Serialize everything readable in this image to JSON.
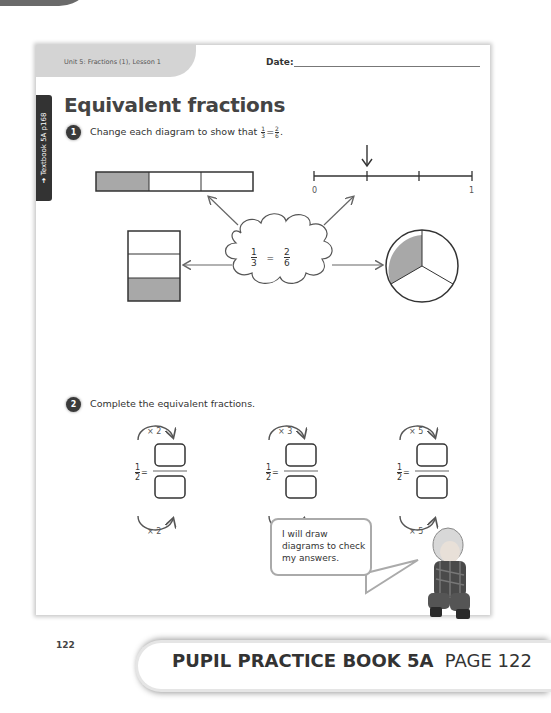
{
  "header": {
    "unit_lesson": "Unit 5: Fractions (1), Lesson 1",
    "date_label": "Date:",
    "side_tab": "➜ Textbook 5A p168"
  },
  "title": "Equivalent fractions",
  "question1": {
    "number": "1",
    "text": "Change each diagram to show that",
    "frac_left": {
      "num": "1",
      "den": "3"
    },
    "equals": "=",
    "frac_right": {
      "num": "2",
      "den": "6"
    },
    "period": ".",
    "cloud": {
      "num1": "1",
      "den1": "3",
      "equals": "=",
      "num2": "2",
      "den2": "6"
    },
    "number_line": {
      "start": "0",
      "end": "1"
    }
  },
  "question2": {
    "number": "2",
    "text": "Complete the equivalent fractions.",
    "items": [
      {
        "num": "1",
        "den": "2",
        "equals": "=",
        "top_mult": "× 2",
        "bottom_mult": "× 2"
      },
      {
        "num": "1",
        "den": "2",
        "equals": "=",
        "top_mult": "× 3",
        "bottom_mult": "× 3"
      },
      {
        "num": "1",
        "den": "2",
        "equals": "=",
        "top_mult": "× 5",
        "bottom_mult": "× 5"
      }
    ]
  },
  "speech_bubble": "I will draw diagrams to check my answers.",
  "page_number": "122",
  "footer": {
    "book": "PUPIL PRACTICE BOOK 5A",
    "page": "PAGE 122"
  },
  "colors": {
    "shade": "#a8a8a8",
    "ink": "#333333",
    "arrow": "#666666"
  }
}
